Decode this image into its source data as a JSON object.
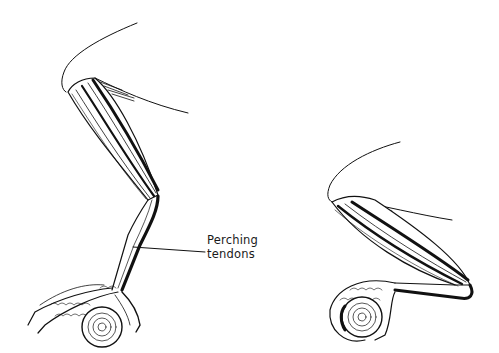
{
  "figure": {
    "ink_color": "#111111",
    "background": "#ffffff"
  },
  "annotation": {
    "line1": "Perching",
    "line2": "tendons"
  }
}
